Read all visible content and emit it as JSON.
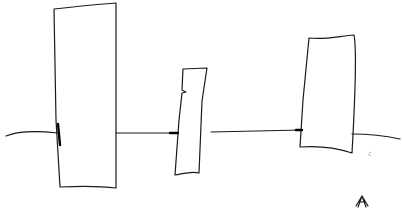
{
  "diagram": {
    "kind": "hand-drawn sketch",
    "stroke_color": "#1a1a1a",
    "background": "#ffffff",
    "connector_line": {
      "path": "M6,136 C20,130 40,131 58,133 M116,133 L178,133 M211,132 L302,130 M352,134 C368,134 386,136 400,139"
    },
    "blocks": [
      {
        "id": "block-1",
        "path": "M54,9 C80,6 100,4 116,3 L116,188 C100,186 80,186 60,187 L56,120 Z"
      },
      {
        "id": "block-2",
        "path": "M183,69 L207,68 L202,101 L199,173 C192,171 186,173 175,175 L179,120 L182,93 L186,92 L182,90 Z"
      },
      {
        "id": "block-3",
        "path": "M309,38 C325,40 340,36 354,35 C357,50 355,100 352,153 C340,149 325,145 300,147 L303,100 Z"
      }
    ],
    "arrow_marks": [
      {
        "x": 172,
        "y": 133
      },
      {
        "x": 301,
        "y": 130
      }
    ],
    "corner_mark": {
      "x": 362,
      "y": 200,
      "label": ""
    }
  }
}
